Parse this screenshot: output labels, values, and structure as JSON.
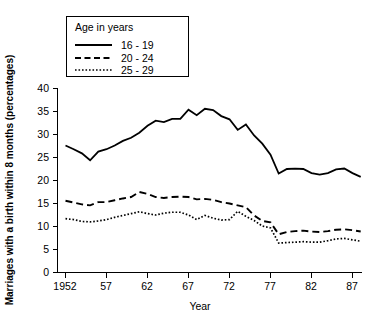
{
  "chart_data": {
    "type": "line",
    "title": "",
    "xlabel": "Year",
    "ylabel": "Marriages with a birth within 8 months (percentages)",
    "xlim": [
      1952,
      1988
    ],
    "ylim": [
      0,
      40
    ],
    "grid": false,
    "legend_position": "top-left-inset",
    "legend_title": "Age in years",
    "x_tick_labels": [
      "1952",
      "57",
      "62",
      "67",
      "72",
      "77",
      "82",
      "87"
    ],
    "x_tick_values": [
      1952,
      1957,
      1962,
      1967,
      1972,
      1977,
      1982,
      1987
    ],
    "y_tick_labels": [
      "0",
      "5",
      "10",
      "15",
      "20",
      "25",
      "30",
      "35",
      "40"
    ],
    "y_tick_values": [
      0,
      5,
      10,
      15,
      20,
      25,
      30,
      35,
      40
    ],
    "x": [
      1952,
      1953,
      1954,
      1955,
      1956,
      1957,
      1958,
      1959,
      1960,
      1961,
      1962,
      1963,
      1964,
      1965,
      1966,
      1967,
      1968,
      1969,
      1970,
      1971,
      1972,
      1973,
      1974,
      1975,
      1976,
      1977,
      1978,
      1979,
      1980,
      1981,
      1982,
      1983,
      1984,
      1985,
      1986,
      1987,
      1988
    ],
    "series": [
      {
        "name": "16 - 19",
        "style": "solid",
        "values": [
          27.6,
          26.8,
          25.9,
          24.4,
          26.3,
          26.8,
          27.6,
          28.6,
          29.3,
          30.4,
          31.9,
          33.0,
          32.7,
          33.4,
          33.4,
          35.4,
          34.2,
          35.6,
          35.3,
          34.0,
          33.3,
          31.0,
          32.2,
          29.8,
          28.0,
          25.6,
          21.5,
          22.5,
          22.6,
          22.5,
          21.6,
          21.3,
          21.6,
          22.4,
          22.6,
          21.6,
          20.8
        ]
      },
      {
        "name": "20 - 24",
        "style": "dashed",
        "values": [
          15.6,
          15.2,
          14.8,
          14.6,
          15.3,
          15.3,
          15.7,
          16.1,
          16.4,
          17.5,
          17.1,
          16.4,
          16.2,
          16.4,
          16.5,
          16.4,
          15.9,
          16.0,
          15.8,
          15.3,
          15.0,
          14.6,
          14.2,
          12.4,
          11.2,
          10.9,
          8.3,
          8.8,
          9.0,
          9.1,
          8.9,
          8.8,
          9.0,
          9.3,
          9.4,
          9.2,
          8.9
        ]
      },
      {
        "name": "25 - 29",
        "style": "dotted",
        "values": [
          11.7,
          11.5,
          11.1,
          11.0,
          11.2,
          11.5,
          12.0,
          12.4,
          12.8,
          13.2,
          12.8,
          12.5,
          12.9,
          13.1,
          13.1,
          12.5,
          11.5,
          12.4,
          11.8,
          11.4,
          11.5,
          13.3,
          12.2,
          11.3,
          10.1,
          9.7,
          6.4,
          6.5,
          6.6,
          6.7,
          6.6,
          6.6,
          6.9,
          7.3,
          7.4,
          7.1,
          6.8
        ]
      }
    ]
  }
}
